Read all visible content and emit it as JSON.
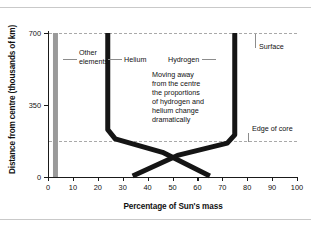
{
  "figure": {
    "x_axis_title": "Percentage of Sun's mass",
    "y_axis_title": "Distance from centre (thousands of km)"
  },
  "annotations": {
    "other_elements": "Other\nelements",
    "other_elements_line1": "Other",
    "other_elements_line2": "elements",
    "helium": "Helium",
    "hydrogen": "Hydrogen",
    "surface": "Surface",
    "edge_of_core": "Edge of core",
    "note": "Moving away\nfrom the centre\nthe proportions\nof hydrogen and\nhelium change\ndramatically",
    "note_line1": "Moving away",
    "note_line2": "from the centre",
    "note_line3": "the proportions",
    "note_line4": "of hydrogen and",
    "note_line5": "helium change",
    "note_line6": "dramatically"
  },
  "ticks": {
    "y": [
      "0",
      "350",
      "700"
    ],
    "x": [
      "0",
      "10",
      "20",
      "30",
      "40",
      "50",
      "60",
      "70",
      "80",
      "90",
      "100"
    ]
  },
  "chart_data": {
    "type": "line",
    "title": "",
    "subtitle": "",
    "xlabel": "Percentage of Sun's mass",
    "ylabel": "Distance from centre (thousands of km)",
    "xlim": [
      0,
      100
    ],
    "ylim": [
      0,
      730
    ],
    "xticks": [
      0,
      10,
      20,
      30,
      40,
      50,
      60,
      70,
      80,
      90,
      100
    ],
    "yticks": [
      0,
      350,
      700
    ],
    "grid": false,
    "legend": "none (inline labels)",
    "reference_lines": [
      {
        "name": "Surface",
        "y": 700,
        "style": "dashed",
        "color": "#a9a9a9"
      },
      {
        "name": "Edge of core",
        "y": 175,
        "style": "dashed",
        "color": "#a9a9a9"
      }
    ],
    "series": [
      {
        "name": "Other elements",
        "color": "#9a9a9a",
        "linewidth_px": 5,
        "points": [
          {
            "x": 3,
            "y": 700
          },
          {
            "x": 3,
            "y": 175
          },
          {
            "x": 3,
            "y": 0
          }
        ]
      },
      {
        "name": "Helium",
        "color": "#151515",
        "linewidth_px": 5,
        "points": [
          {
            "x": 24,
            "y": 700
          },
          {
            "x": 24,
            "y": 230
          },
          {
            "x": 27,
            "y": 185
          },
          {
            "x": 46,
            "y": 120
          },
          {
            "x": 65,
            "y": 5
          }
        ]
      },
      {
        "name": "Hydrogen",
        "color": "#151515",
        "linewidth_px": 5,
        "points": [
          {
            "x": 75,
            "y": 700
          },
          {
            "x": 75,
            "y": 205
          },
          {
            "x": 72,
            "y": 165
          },
          {
            "x": 52,
            "y": 105
          },
          {
            "x": 34,
            "y": 5
          }
        ]
      }
    ],
    "annotations": [
      {
        "text": "Other elements",
        "x": 8,
        "y": 575
      },
      {
        "text": "Helium",
        "x": 30,
        "y": 575
      },
      {
        "text": "Hydrogen",
        "x": 57,
        "y": 575
      },
      {
        "text": "Surface",
        "x": 93,
        "y": 640,
        "points_to_y": 700
      },
      {
        "text": "Edge of core",
        "x": 93,
        "y": 255,
        "points_to_y": 175
      },
      {
        "text": "Moving away from the centre the proportions of hydrogen and helium change dramatically",
        "x": 44,
        "y": 470
      }
    ]
  }
}
